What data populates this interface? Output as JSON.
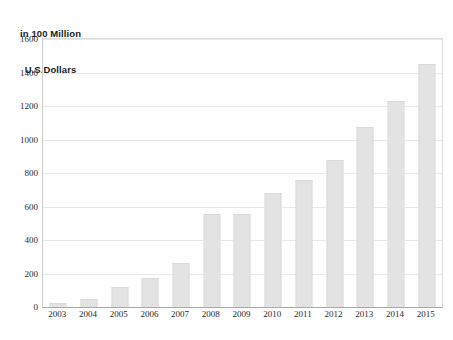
{
  "chart_data": {
    "type": "bar",
    "title": "in 100 Million U.S.Dollars",
    "title_lines": [
      "in 100 Million",
      "U.S.Dollars"
    ],
    "xlabel": "",
    "ylabel": "in 100 Million U.S.Dollars",
    "categories": [
      "2003",
      "2004",
      "2005",
      "2006",
      "2007",
      "2008",
      "2009",
      "2010",
      "2011",
      "2012",
      "2013",
      "2014",
      "2015"
    ],
    "values": [
      25,
      50,
      120,
      175,
      265,
      553,
      557,
      683,
      760,
      875,
      1075,
      1228,
      1450
    ],
    "ylim": [
      0,
      1600
    ],
    "y_ticks": [
      0,
      200,
      400,
      600,
      800,
      1000,
      1200,
      1400,
      1600
    ],
    "y_tick_labels": [
      "0",
      "200",
      "400",
      "600",
      "800",
      "1000",
      "1200",
      "1400",
      "1600"
    ],
    "grid": true,
    "legend": false,
    "legend_position": "none",
    "bar_color": "#e3e3e3",
    "gridline_color": "#e8e8e8",
    "axis_color": "#a9a9a9",
    "background_color": "#ffffff",
    "text_color": "#2a2a2a"
  }
}
